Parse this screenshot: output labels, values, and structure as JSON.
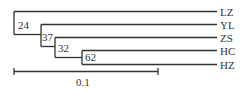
{
  "tree": {
    "taxa": [
      "LZ",
      "YL",
      "ZS",
      "HC",
      "HZ"
    ],
    "bootstrap": [
      "24",
      "37",
      "32",
      "62"
    ],
    "scale_label": "0.1",
    "line_color": "#333333"
  }
}
